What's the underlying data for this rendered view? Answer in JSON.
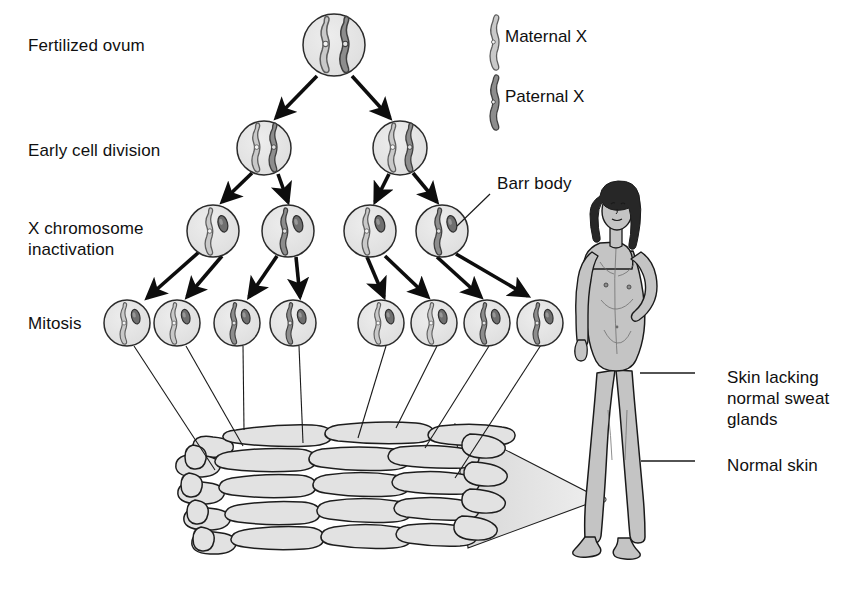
{
  "figure": {
    "stage_labels": [
      {
        "id": "fertilized-ovum",
        "text": "Fertilized ovum",
        "x": 28,
        "y": 35
      },
      {
        "id": "early-cell-division",
        "text": "Early cell division",
        "x": 28,
        "y": 140
      },
      {
        "id": "x-chromosome-inactivation-line1",
        "text": "X chromosome",
        "x": 28,
        "y": 218
      },
      {
        "id": "x-chromosome-inactivation-line2",
        "text": "inactivation",
        "x": 28,
        "y": 239
      },
      {
        "id": "mitosis",
        "text": "Mitosis",
        "x": 28,
        "y": 313
      }
    ],
    "legend": {
      "items": [
        {
          "id": "maternal-x",
          "label": "Maternal X",
          "color": "#c9c9c9",
          "stroke": "#5a5a5a",
          "x": 505,
          "y": 27,
          "swatch_x": 484,
          "swatch_y": 20
        },
        {
          "id": "paternal-x",
          "label": "Paternal X",
          "color": "#8d8d8d",
          "stroke": "#454545",
          "x": 505,
          "y": 87,
          "swatch_x": 484,
          "swatch_y": 80
        }
      ]
    },
    "callouts": [
      {
        "id": "barr-body",
        "text": "Barr body",
        "x": 497,
        "y": 173,
        "leader": {
          "x1": 490,
          "y1": 194,
          "x2": 457,
          "y2": 226
        }
      },
      {
        "id": "skin-lacking-sweat-glands-l1",
        "text": "Skin lacking",
        "x": 727,
        "y": 367
      },
      {
        "id": "skin-lacking-sweat-glands-l2",
        "text": "normal sweat",
        "x": 727,
        "y": 388
      },
      {
        "id": "skin-lacking-sweat-glands-l3",
        "text": "glands",
        "x": 727,
        "y": 409
      },
      {
        "id": "normal-skin",
        "text": "Normal skin",
        "x": 727,
        "y": 455
      }
    ],
    "callout_leaders": [
      {
        "id": "leader-sweat-glands",
        "x1": 695,
        "y1": 373,
        "x2": 640,
        "y2": 373
      },
      {
        "id": "leader-normal-skin",
        "x1": 695,
        "y1": 461,
        "x2": 641,
        "y2": 461
      }
    ],
    "colors": {
      "cell_fill": "#e3e3e3",
      "cell_stroke": "#2b2b2b",
      "maternal": "#c9c9c9",
      "maternal_stroke": "#5e5e5e",
      "paternal": "#8d8d8d",
      "paternal_stroke": "#3f3f3f",
      "barr_body": "#6f6f6f",
      "barr_body_stroke": "#2e2e2e",
      "skin_fill": "#e0e0e0",
      "skin_stroke": "#1d1d1d",
      "cone_fill": "#dcdcdc",
      "body_fill": "#c4c4c4",
      "body_stroke": "#1a1a1a",
      "hair": "#272727",
      "arrow": "#0d0d0d",
      "thin_line": "#1a1a1a"
    },
    "lineage": {
      "rows": [
        {
          "id": "row-ovum",
          "stage": "fertilized ovum",
          "cy": 45,
          "r": 31,
          "cells": [
            {
              "id": "ovum-1",
              "cx": 334,
              "active": [
                "maternal",
                "paternal"
              ],
              "barr": false
            }
          ]
        },
        {
          "id": "row-early-division",
          "stage": "early cell division",
          "cy": 148,
          "r": 27,
          "cells": [
            {
              "id": "early-1",
              "cx": 264,
              "active": [
                "maternal",
                "paternal"
              ],
              "barr": false
            },
            {
              "id": "early-2",
              "cx": 400,
              "active": [
                "maternal",
                "paternal"
              ],
              "barr": false
            }
          ]
        },
        {
          "id": "row-inactivation",
          "stage": "X chromosome inactivation",
          "cy": 231,
          "r": 26,
          "cells": [
            {
              "id": "inact-1",
              "cx": 213,
              "active": [
                "maternal"
              ],
              "barr": true
            },
            {
              "id": "inact-2",
              "cx": 288,
              "active": [
                "paternal"
              ],
              "barr": true
            },
            {
              "id": "inact-3",
              "cx": 370,
              "active": [
                "maternal"
              ],
              "barr": true
            },
            {
              "id": "inact-4",
              "cx": 442,
              "active": [
                "paternal"
              ],
              "barr": true
            }
          ]
        },
        {
          "id": "row-mitosis",
          "stage": "mitosis",
          "cy": 323,
          "r": 23,
          "cells": [
            {
              "id": "mito-1",
              "cx": 127,
              "active": [
                "maternal"
              ],
              "barr": true
            },
            {
              "id": "mito-2",
              "cx": 177,
              "active": [
                "maternal"
              ],
              "barr": true
            },
            {
              "id": "mito-3",
              "cx": 237,
              "active": [
                "paternal"
              ],
              "barr": true
            },
            {
              "id": "mito-4",
              "cx": 293,
              "active": [
                "paternal"
              ],
              "barr": true
            },
            {
              "id": "mito-5",
              "cx": 381,
              "active": [
                "maternal"
              ],
              "barr": true
            },
            {
              "id": "mito-6",
              "cx": 434,
              "active": [
                "maternal"
              ],
              "barr": true
            },
            {
              "id": "mito-7",
              "cx": 487,
              "active": [
                "paternal"
              ],
              "barr": true
            },
            {
              "id": "mito-8",
              "cx": 540,
              "active": [
                "paternal"
              ],
              "barr": true
            }
          ]
        }
      ],
      "division_arrows": [
        {
          "id": "arrow-ovum-to-early-1",
          "x1": 317,
          "y1": 76,
          "x2": 276,
          "y2": 118
        },
        {
          "id": "arrow-ovum-to-early-2",
          "x1": 352,
          "y1": 76,
          "x2": 390,
          "y2": 118
        },
        {
          "id": "arrow-early1-to-inact1",
          "x1": 252,
          "y1": 173,
          "x2": 222,
          "y2": 202
        },
        {
          "id": "arrow-early1-to-inact2",
          "x1": 278,
          "y1": 174,
          "x2": 288,
          "y2": 202
        },
        {
          "id": "arrow-early2-to-inact3",
          "x1": 389,
          "y1": 174,
          "x2": 375,
          "y2": 202
        },
        {
          "id": "arrow-early2-to-inact4",
          "x1": 413,
          "y1": 173,
          "x2": 437,
          "y2": 202
        },
        {
          "id": "arrow-inact1-to-mito1",
          "x1": 199,
          "y1": 252,
          "x2": 147,
          "y2": 298
        },
        {
          "id": "arrow-inact1-to-mito2",
          "x1": 222,
          "y1": 256,
          "x2": 187,
          "y2": 297
        },
        {
          "id": "arrow-inact2-to-mito3",
          "x1": 277,
          "y1": 256,
          "x2": 249,
          "y2": 297
        },
        {
          "id": "arrow-inact2-to-mito4",
          "x1": 296,
          "y1": 257,
          "x2": 300,
          "y2": 297
        },
        {
          "id": "arrow-inact3-to-mito5",
          "x1": 367,
          "y1": 257,
          "x2": 384,
          "y2": 297
        },
        {
          "id": "arrow-inact3-to-mito6",
          "x1": 385,
          "y1": 256,
          "x2": 428,
          "y2": 297
        },
        {
          "id": "arrow-inact4-to-mito7",
          "x1": 437,
          "y1": 257,
          "x2": 481,
          "y2": 297
        },
        {
          "id": "arrow-inact4-to-mito8",
          "x1": 456,
          "y1": 254,
          "x2": 528,
          "y2": 296
        }
      ],
      "skin_connectors": [
        {
          "id": "connector-1",
          "x1": 134,
          "y1": 346,
          "x2": 215,
          "y2": 470
        },
        {
          "id": "connector-2",
          "x1": 186,
          "y1": 346,
          "x2": 243,
          "y2": 446
        },
        {
          "id": "connector-3",
          "x1": 243,
          "y1": 346,
          "x2": 244,
          "y2": 430
        },
        {
          "id": "connector-4",
          "x1": 299,
          "y1": 346,
          "x2": 303,
          "y2": 443
        },
        {
          "id": "connector-5",
          "x1": 386,
          "y1": 346,
          "x2": 358,
          "y2": 438
        },
        {
          "id": "connector-6",
          "x1": 437,
          "y1": 346,
          "x2": 396,
          "y2": 428
        },
        {
          "id": "connector-7",
          "x1": 489,
          "y1": 346,
          "x2": 425,
          "y2": 448
        },
        {
          "id": "connector-8",
          "x1": 541,
          "y1": 345,
          "x2": 455,
          "y2": 478
        }
      ]
    },
    "skin_patch": {
      "id": "skin-tissue-block",
      "x": 188,
      "y": 418,
      "width": 320,
      "height": 140
    },
    "magnification_cone": {
      "id": "magnification-cone",
      "apex_x": 601,
      "apex_y": 500,
      "top_x": 455,
      "top_y": 424,
      "bottom_x": 468,
      "bottom_y": 548
    },
    "person": {
      "id": "female-figure",
      "x": 565,
      "y": 186,
      "width": 165,
      "height": 385
    }
  }
}
